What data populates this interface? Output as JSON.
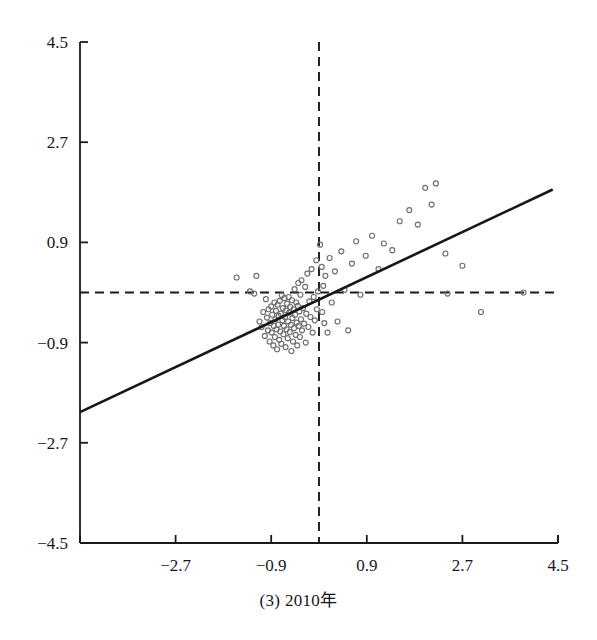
{
  "caption": "(3) 2010年",
  "colors": {
    "axis": "#1a1a1a",
    "marker_stroke": "#6e6e6e",
    "regression_line": "#171717",
    "reference_line": "#1a1a1a",
    "background": "#ffffff"
  },
  "chart_data": {
    "type": "scatter",
    "title": "(3) 2010年",
    "xlabel": "",
    "ylabel": "",
    "xlim": [
      -4.5,
      4.5
    ],
    "ylim": [
      -4.5,
      4.5
    ],
    "grid": false,
    "legend": "none",
    "xticks": [
      -4.5,
      -2.7,
      -0.9,
      0.9,
      2.7,
      4.5
    ],
    "xticklabels": [
      "",
      "−2.7",
      "−0.9",
      "0.9",
      "2.7",
      "4.5"
    ],
    "yticks": [
      -4.5,
      -2.7,
      -0.9,
      0.9,
      2.7,
      4.5
    ],
    "yticklabels": [
      "−4.5",
      "−2.7",
      "−0.9",
      "0.9",
      "2.7",
      "4.5"
    ],
    "reference_lines": [
      {
        "orientation": "horizontal",
        "value": 0,
        "style": "dashed"
      },
      {
        "orientation": "vertical",
        "value": 0,
        "style": "dashed"
      }
    ],
    "fit_line": {
      "style": "solid",
      "slope": 0.45,
      "intercept": -0.13,
      "x_start": -4.5,
      "y_start": -2.15,
      "x_end": 4.4,
      "y_end": 1.85
    },
    "marker": {
      "shape": "open-circle",
      "size": 5
    },
    "n_points": 112,
    "points": [
      [
        -1.55,
        0.27
      ],
      [
        -1.3,
        0.02
      ],
      [
        -1.22,
        -0.02
      ],
      [
        -1.18,
        0.3
      ],
      [
        -1.12,
        -0.52
      ],
      [
        -1.08,
        -0.62
      ],
      [
        -1.05,
        -0.35
      ],
      [
        -1.02,
        -0.78
      ],
      [
        -1.0,
        -0.12
      ],
      [
        -0.98,
        -0.45
      ],
      [
        -0.96,
        -0.68
      ],
      [
        -0.95,
        -0.3
      ],
      [
        -0.93,
        -0.88
      ],
      [
        -0.92,
        -0.55
      ],
      [
        -0.9,
        -0.25
      ],
      [
        -0.89,
        -0.72
      ],
      [
        -0.88,
        -0.4
      ],
      [
        -0.86,
        -0.95
      ],
      [
        -0.85,
        -0.6
      ],
      [
        -0.84,
        -0.18
      ],
      [
        -0.83,
        -0.8
      ],
      [
        -0.82,
        -0.48
      ],
      [
        -0.81,
        -0.33
      ],
      [
        -0.8,
        -0.66
      ],
      [
        -0.79,
        -1.02
      ],
      [
        -0.78,
        -0.22
      ],
      [
        -0.77,
        -0.58
      ],
      [
        -0.76,
        -0.42
      ],
      [
        -0.75,
        -0.85
      ],
      [
        -0.74,
        -0.15
      ],
      [
        -0.73,
        -0.7
      ],
      [
        -0.72,
        -0.38
      ],
      [
        -0.71,
        -0.92
      ],
      [
        -0.7,
        -0.05
      ],
      [
        -0.69,
        -0.5
      ],
      [
        -0.68,
        -0.28
      ],
      [
        -0.67,
        -0.75
      ],
      [
        -0.66,
        -0.6
      ],
      [
        -0.65,
        -0.1
      ],
      [
        -0.64,
        -0.44
      ],
      [
        -0.63,
        -0.98
      ],
      [
        -0.62,
        -0.32
      ],
      [
        -0.61,
        -0.66
      ],
      [
        -0.6,
        -0.2
      ],
      [
        -0.59,
        -0.82
      ],
      [
        -0.58,
        -0.52
      ],
      [
        -0.57,
        -0.08
      ],
      [
        -0.56,
        -0.36
      ],
      [
        -0.55,
        -0.71
      ],
      [
        -0.54,
        -0.26
      ],
      [
        -0.53,
        -0.58
      ],
      [
        -0.52,
        -1.05
      ],
      [
        -0.51,
        -0.14
      ],
      [
        -0.5,
        -0.46
      ],
      [
        -0.49,
        -0.88
      ],
      [
        -0.48,
        -0.3
      ],
      [
        -0.47,
        -0.64
      ],
      [
        -0.46,
        0.06
      ],
      [
        -0.45,
        -0.4
      ],
      [
        -0.44,
        -0.76
      ],
      [
        -0.43,
        -0.18
      ],
      [
        -0.42,
        -0.54
      ],
      [
        -0.41,
        -0.95
      ],
      [
        -0.4,
        -0.24
      ],
      [
        -0.39,
        0.17
      ],
      [
        -0.38,
        -0.6
      ],
      [
        -0.37,
        -0.34
      ],
      [
        -0.36,
        -0.8
      ],
      [
        -0.35,
        -0.04
      ],
      [
        -0.34,
        -0.48
      ],
      [
        -0.33,
        0.22
      ],
      [
        -0.32,
        -0.68
      ],
      [
        -0.3,
        -0.28
      ],
      [
        -0.28,
        -0.56
      ],
      [
        -0.26,
        0.1
      ],
      [
        -0.25,
        -0.9
      ],
      [
        -0.24,
        -0.38
      ],
      [
        -0.22,
        0.34
      ],
      [
        -0.2,
        -0.62
      ],
      [
        -0.18,
        -0.16
      ],
      [
        -0.16,
        -0.44
      ],
      [
        -0.14,
        0.42
      ],
      [
        -0.12,
        -0.72
      ],
      [
        -0.1,
        -0.08
      ],
      [
        -0.08,
        -0.5
      ],
      [
        -0.05,
        0.58
      ],
      [
        -0.04,
        -0.3
      ],
      [
        -0.02,
        0.02
      ],
      [
        0.02,
        0.86
      ],
      [
        0.05,
        0.46
      ],
      [
        0.06,
        -0.35
      ],
      [
        0.08,
        0.12
      ],
      [
        0.1,
        -0.55
      ],
      [
        0.12,
        0.3
      ],
      [
        0.16,
        -0.72
      ],
      [
        0.2,
        0.62
      ],
      [
        0.24,
        -0.18
      ],
      [
        0.3,
        0.38
      ],
      [
        0.35,
        -0.52
      ],
      [
        0.42,
        0.74
      ],
      [
        0.48,
        0.05
      ],
      [
        0.55,
        -0.68
      ],
      [
        0.62,
        0.52
      ],
      [
        0.7,
        0.92
      ],
      [
        0.78,
        -0.04
      ],
      [
        0.88,
        0.66
      ],
      [
        1.0,
        1.02
      ],
      [
        1.12,
        0.42
      ],
      [
        1.22,
        0.88
      ],
      [
        1.38,
        0.76
      ],
      [
        1.52,
        1.28
      ],
      [
        1.7,
        1.48
      ],
      [
        1.86,
        1.22
      ],
      [
        2.0,
        1.88
      ],
      [
        2.12,
        1.58
      ],
      [
        2.2,
        1.96
      ],
      [
        2.38,
        0.7
      ],
      [
        2.42,
        -0.02
      ],
      [
        2.7,
        0.48
      ],
      [
        3.85,
        0.0
      ],
      [
        3.05,
        -0.35
      ]
    ]
  },
  "geometry": {
    "plot_left": 80,
    "plot_right": 558,
    "plot_top": 42,
    "plot_bottom": 543,
    "origin_x": 313,
    "origin_y": 292
  }
}
